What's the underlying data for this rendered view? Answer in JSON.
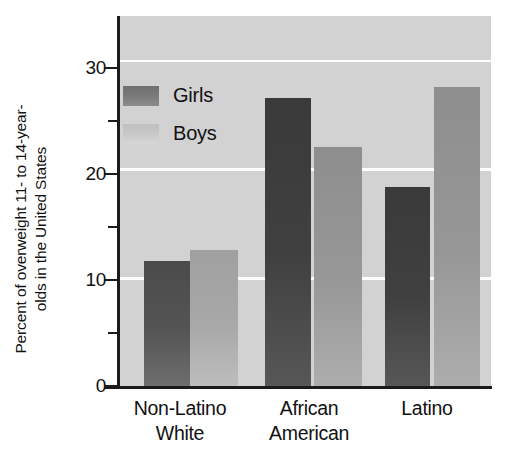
{
  "chart_data": {
    "type": "bar",
    "title": "",
    "subtitle": "",
    "xlabel": "",
    "ylabel": "Percent of overweight 11- to 14-year-olds in the United States",
    "ylabel_line1": "Percent of overweight 11- to 14-year-",
    "ylabel_line2": "olds in the United States",
    "categories": [
      "Non-Latino White",
      "African American",
      "Latino"
    ],
    "category_lines": [
      [
        "Non-Latino",
        "White"
      ],
      [
        "African",
        "American"
      ],
      [
        "Latino",
        ""
      ]
    ],
    "series": [
      {
        "name": "Girls",
        "values": [
          11.5,
          26.5,
          18.3
        ],
        "color": "#4f4f4f"
      },
      {
        "name": "Boys",
        "values": [
          12.5,
          22.0,
          27.5
        ],
        "color": "#a8a8a8"
      }
    ],
    "legend": [
      "Girls",
      "Boys"
    ],
    "legend_position": "inside-top-left",
    "ylim": [
      0,
      34
    ],
    "yticks_major": [
      0,
      10,
      20,
      30
    ],
    "yticks_minor": [
      5,
      15,
      25
    ],
    "ytick_labels": [
      "0",
      "10",
      "20",
      "30"
    ],
    "gridlines": [
      10,
      20,
      30
    ],
    "grid": true,
    "grid_color": "#fdfdfd",
    "plot_background": "#d2d2d2"
  },
  "axis": {
    "y_title_line1": "Percent of overweight 11- to 14-year-",
    "y_title_line2": "olds in the United States",
    "tick_0": "0",
    "tick_10": "10",
    "tick_20": "20",
    "tick_30": "30"
  },
  "legend": {
    "girls_label": "Girls",
    "boys_label": "Boys"
  },
  "groups": {
    "g1_line1": "Non-Latino",
    "g1_line2": "White",
    "g2_line1": "African",
    "g2_line2": "American",
    "g3_line1": "Latino",
    "g3_line2": ""
  }
}
